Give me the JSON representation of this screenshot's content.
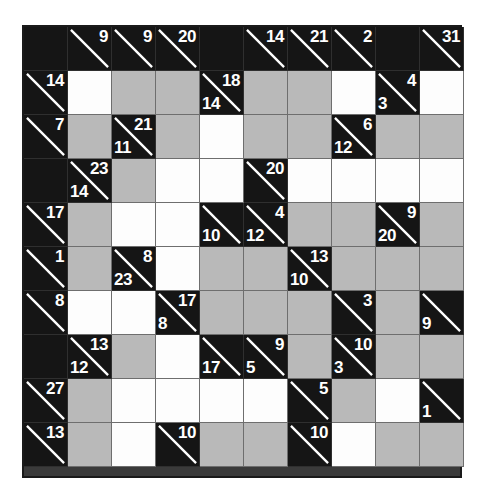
{
  "puzzle": {
    "type": "kakuro",
    "rows": 10,
    "cols": 10,
    "cell_size_px": 44,
    "colors": {
      "block": "#151515",
      "clue_text": "#ffffff",
      "white_cell": "#fdfdfd",
      "gray_cell": "#b9b9b9",
      "grid_line": "#6e6e6e",
      "page_background": "#ffffff"
    },
    "legend": {
      "clue_down_position": "upper-right",
      "clue_across_position": "lower-left",
      "diagonal": "white line from top-left to bottom-right"
    },
    "grid": [
      [
        {
          "kind": "block"
        },
        {
          "kind": "clue",
          "down": "9",
          "across": ""
        },
        {
          "kind": "clue",
          "down": "9",
          "across": ""
        },
        {
          "kind": "clue",
          "down": "20",
          "across": ""
        },
        {
          "kind": "block"
        },
        {
          "kind": "clue",
          "down": "14",
          "across": ""
        },
        {
          "kind": "clue",
          "down": "21",
          "across": ""
        },
        {
          "kind": "clue",
          "down": "2",
          "across": ""
        },
        {
          "kind": "block"
        },
        {
          "kind": "clue",
          "down": "31",
          "across": ""
        }
      ],
      [
        {
          "kind": "clue",
          "down": "14",
          "across": ""
        },
        {
          "kind": "white",
          "value": ""
        },
        {
          "kind": "gray",
          "value": ""
        },
        {
          "kind": "gray",
          "value": ""
        },
        {
          "kind": "clue",
          "down": "18",
          "across": "14"
        },
        {
          "kind": "gray",
          "value": ""
        },
        {
          "kind": "gray",
          "value": ""
        },
        {
          "kind": "white",
          "value": ""
        },
        {
          "kind": "clue",
          "down": "4",
          "across": "3"
        },
        {
          "kind": "white",
          "value": ""
        }
      ],
      [
        {
          "kind": "clue",
          "down": "7",
          "across": ""
        },
        {
          "kind": "gray",
          "value": ""
        },
        {
          "kind": "clue",
          "down": "21",
          "across": "11"
        },
        {
          "kind": "gray",
          "value": ""
        },
        {
          "kind": "white",
          "value": ""
        },
        {
          "kind": "gray",
          "value": ""
        },
        {
          "kind": "gray",
          "value": ""
        },
        {
          "kind": "clue",
          "down": "6",
          "across": "12"
        },
        {
          "kind": "gray",
          "value": ""
        },
        {
          "kind": "gray",
          "value": ""
        }
      ],
      [
        {
          "kind": "block"
        },
        {
          "kind": "clue",
          "down": "23",
          "across": "14"
        },
        {
          "kind": "gray",
          "value": ""
        },
        {
          "kind": "white",
          "value": ""
        },
        {
          "kind": "white",
          "value": ""
        },
        {
          "kind": "clue",
          "down": "20",
          "across": ""
        },
        {
          "kind": "white",
          "value": ""
        },
        {
          "kind": "white",
          "value": ""
        },
        {
          "kind": "white",
          "value": ""
        },
        {
          "kind": "white",
          "value": ""
        }
      ],
      [
        {
          "kind": "clue",
          "down": "17",
          "across": ""
        },
        {
          "kind": "gray",
          "value": ""
        },
        {
          "kind": "white",
          "value": ""
        },
        {
          "kind": "white",
          "value": ""
        },
        {
          "kind": "clue",
          "down": "",
          "across": "10"
        },
        {
          "kind": "clue",
          "down": "4",
          "across": "12"
        },
        {
          "kind": "gray",
          "value": ""
        },
        {
          "kind": "gray",
          "value": ""
        },
        {
          "kind": "clue",
          "down": "9",
          "across": "20"
        },
        {
          "kind": "gray",
          "value": ""
        }
      ],
      [
        {
          "kind": "clue",
          "down": "1",
          "across": ""
        },
        {
          "kind": "gray",
          "value": ""
        },
        {
          "kind": "clue",
          "down": "8",
          "across": "23"
        },
        {
          "kind": "white",
          "value": ""
        },
        {
          "kind": "gray",
          "value": ""
        },
        {
          "kind": "gray",
          "value": ""
        },
        {
          "kind": "clue",
          "down": "13",
          "across": "10"
        },
        {
          "kind": "gray",
          "value": ""
        },
        {
          "kind": "gray",
          "value": ""
        },
        {
          "kind": "gray",
          "value": ""
        }
      ],
      [
        {
          "kind": "clue",
          "down": "8",
          "across": ""
        },
        {
          "kind": "white",
          "value": ""
        },
        {
          "kind": "white",
          "value": ""
        },
        {
          "kind": "clue",
          "down": "17",
          "across": "8"
        },
        {
          "kind": "gray",
          "value": ""
        },
        {
          "kind": "gray",
          "value": ""
        },
        {
          "kind": "gray",
          "value": ""
        },
        {
          "kind": "clue",
          "down": "3",
          "across": ""
        },
        {
          "kind": "gray",
          "value": ""
        },
        {
          "kind": "clue",
          "down": "",
          "across": "9"
        }
      ],
      [
        {
          "kind": "block"
        },
        {
          "kind": "clue",
          "down": "13",
          "across": "12"
        },
        {
          "kind": "gray",
          "value": ""
        },
        {
          "kind": "white",
          "value": ""
        },
        {
          "kind": "clue",
          "down": "",
          "across": "17"
        },
        {
          "kind": "clue",
          "down": "9",
          "across": "5"
        },
        {
          "kind": "gray",
          "value": ""
        },
        {
          "kind": "clue",
          "down": "10",
          "across": "3"
        },
        {
          "kind": "gray",
          "value": ""
        },
        {
          "kind": "gray",
          "value": ""
        }
      ],
      [
        {
          "kind": "clue",
          "down": "27",
          "across": ""
        },
        {
          "kind": "gray",
          "value": ""
        },
        {
          "kind": "white",
          "value": ""
        },
        {
          "kind": "white",
          "value": ""
        },
        {
          "kind": "white",
          "value": ""
        },
        {
          "kind": "white",
          "value": ""
        },
        {
          "kind": "clue",
          "down": "5",
          "across": ""
        },
        {
          "kind": "gray",
          "value": ""
        },
        {
          "kind": "white",
          "value": ""
        },
        {
          "kind": "clue",
          "down": "",
          "across": "1"
        }
      ],
      [
        {
          "kind": "clue",
          "down": "13",
          "across": ""
        },
        {
          "kind": "gray",
          "value": ""
        },
        {
          "kind": "white",
          "value": ""
        },
        {
          "kind": "clue",
          "down": "10",
          "across": ""
        },
        {
          "kind": "gray",
          "value": ""
        },
        {
          "kind": "gray",
          "value": ""
        },
        {
          "kind": "clue",
          "down": "10",
          "across": ""
        },
        {
          "kind": "white",
          "value": ""
        },
        {
          "kind": "gray",
          "value": ""
        },
        {
          "kind": "gray",
          "value": ""
        }
      ]
    ]
  }
}
